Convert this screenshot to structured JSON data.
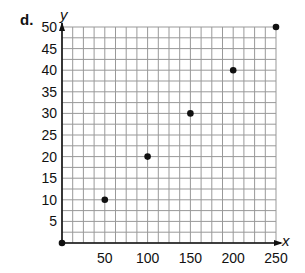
{
  "part_label": "d.",
  "chart_data": {
    "type": "scatter",
    "title": "",
    "xlabel": "x",
    "ylabel": "y",
    "xlim": [
      0,
      250
    ],
    "ylim": [
      0,
      50
    ],
    "grid": true,
    "x_ticks": [
      50,
      100,
      150,
      200,
      250
    ],
    "y_ticks": [
      5,
      10,
      15,
      20,
      25,
      30,
      35,
      40,
      45,
      50
    ],
    "points": [
      {
        "x": 0,
        "y": 0
      },
      {
        "x": 50,
        "y": 10
      },
      {
        "x": 100,
        "y": 20
      },
      {
        "x": 150,
        "y": 30
      },
      {
        "x": 200,
        "y": 40
      },
      {
        "x": 250,
        "y": 50
      }
    ]
  }
}
